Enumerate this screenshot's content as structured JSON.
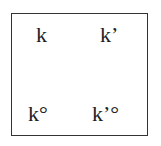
{
  "diagram": {
    "cells": [
      {
        "position": "top-left",
        "label": "k"
      },
      {
        "position": "top-right",
        "label": "k’"
      },
      {
        "position": "bottom-left",
        "label": "k°"
      },
      {
        "position": "bottom-right",
        "label": "k’°"
      }
    ],
    "colors": {
      "border": "#333333",
      "text": "#222222",
      "background": "#ffffff"
    }
  }
}
